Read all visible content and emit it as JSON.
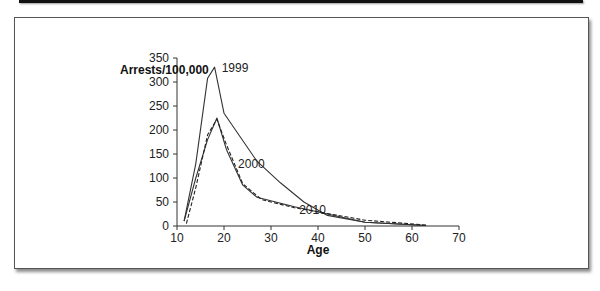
{
  "figure": {
    "ylabel": "Arrests/100,000",
    "xlabel": "Age"
  },
  "chart_data": {
    "type": "line",
    "title": "",
    "xlabel": "Age",
    "ylabel": "Arrests/100,000",
    "xlim": [
      10,
      70
    ],
    "ylim": [
      0,
      350
    ],
    "x_ticks": [
      10,
      20,
      30,
      40,
      50,
      60,
      70
    ],
    "y_ticks": [
      0,
      50,
      100,
      150,
      200,
      250,
      300,
      350
    ],
    "grid": false,
    "legend": "inline labels next to curves",
    "series": [
      {
        "name": "1999",
        "style": "solid",
        "x": [
          11.5,
          14,
          16.5,
          18,
          20,
          27,
          32,
          37,
          42,
          50,
          63
        ],
        "values": [
          10,
          130,
          308,
          331,
          235,
          135,
          90,
          50,
          22,
          8,
          1
        ]
      },
      {
        "name": "2000",
        "style": "solid",
        "x": [
          11.5,
          14,
          16.5,
          18.5,
          20.5,
          24,
          27,
          35,
          42,
          50,
          63
        ],
        "values": [
          10,
          100,
          180,
          225,
          160,
          85,
          60,
          40,
          25,
          8,
          1
        ]
      },
      {
        "name": "2010",
        "style": "dashed",
        "x": [
          12,
          14,
          16.5,
          18.5,
          20.5,
          24,
          28,
          35,
          42,
          50,
          63
        ],
        "values": [
          5,
          80,
          190,
          222,
          170,
          88,
          55,
          38,
          26,
          12,
          2
        ]
      }
    ],
    "annotations": [
      {
        "text": "1999",
        "x": 19.5,
        "y": 320
      },
      {
        "text": "2000",
        "x": 23,
        "y": 120
      },
      {
        "text": "2010",
        "x": 36,
        "y": 25
      }
    ]
  }
}
